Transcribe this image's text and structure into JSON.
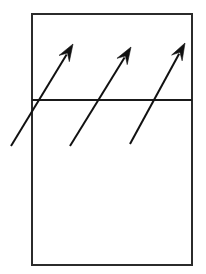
{
  "figure": {
    "title": "",
    "canvas": {
      "width": 206,
      "height": 274,
      "background": "#ffffff"
    },
    "styles": {
      "line_color": "#1a1a1a",
      "outline_color": "#2b2b2b",
      "arrow_color": "#111111",
      "outline_width": 2,
      "divider_width": 2,
      "arrow_width": 2
    },
    "shapes": {
      "rectangle": {
        "label": "outer-rectangle",
        "x": 32,
        "y": 14,
        "width": 160,
        "height": 251,
        "fill": "none",
        "stroke": "#2b2b2b",
        "stroke_width": 2
      },
      "divider": {
        "label": "horizontal-divider-line",
        "x1": 32,
        "y1": 100,
        "x2": 192,
        "y2": 100,
        "stroke": "#1a1a1a",
        "stroke_width": 2
      }
    },
    "arrows": [
      {
        "label": "arrow-1",
        "tail_x": 11,
        "tail_y": 146,
        "tip_x": 73,
        "tip_y": 44,
        "stroke": "#111111",
        "stroke_width": 2,
        "head_length": 17,
        "head_half_width": 6
      },
      {
        "label": "arrow-2",
        "tail_x": 70,
        "tail_y": 146,
        "tip_x": 131,
        "tip_y": 47,
        "stroke": "#111111",
        "stroke_width": 2,
        "head_length": 17,
        "head_half_width": 6
      },
      {
        "label": "arrow-3",
        "tail_x": 130,
        "tail_y": 144,
        "tip_x": 185,
        "tip_y": 43,
        "stroke": "#111111",
        "stroke_width": 2,
        "head_length": 17,
        "head_half_width": 6
      }
    ]
  }
}
